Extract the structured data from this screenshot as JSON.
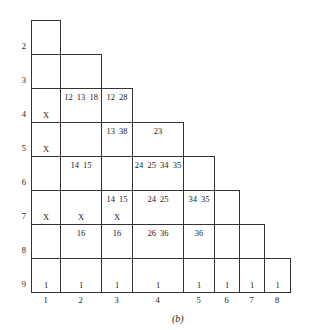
{
  "caption": "(b)",
  "geometry": {
    "col_edges": [
      31,
      60,
      101,
      132,
      183,
      214,
      239,
      264,
      290
    ],
    "row_edges": [
      20,
      54,
      88,
      122,
      156,
      190,
      224,
      258,
      292
    ]
  },
  "row_labels": [
    "2",
    "3",
    "4",
    "5",
    "6",
    "7",
    "8",
    "9"
  ],
  "col_labels": [
    "1",
    "2",
    "3",
    "4",
    "5",
    "6",
    "7",
    "8"
  ],
  "cells": [
    {
      "row": 2,
      "col": 1,
      "top": "",
      "bottom": ""
    },
    {
      "row": 3,
      "col": 1,
      "top": "",
      "bottom": ""
    },
    {
      "row": 3,
      "col": 2,
      "top": "",
      "bottom": ""
    },
    {
      "row": 4,
      "col": 1,
      "top": "",
      "bottom": "X"
    },
    {
      "row": 4,
      "col": 2,
      "top": "12 13 18",
      "bottom": ""
    },
    {
      "row": 4,
      "col": 3,
      "top": "12 28",
      "bottom": ""
    },
    {
      "row": 5,
      "col": 1,
      "top": "",
      "bottom": "X"
    },
    {
      "row": 5,
      "col": 2,
      "top": "",
      "bottom": ""
    },
    {
      "row": 5,
      "col": 3,
      "top": "13 38",
      "bottom": ""
    },
    {
      "row": 5,
      "col": 4,
      "top": "23",
      "bottom": ""
    },
    {
      "row": 6,
      "col": 1,
      "top": "",
      "bottom": ""
    },
    {
      "row": 6,
      "col": 2,
      "top": "14 15",
      "bottom": ""
    },
    {
      "row": 6,
      "col": 3,
      "top": "",
      "bottom": ""
    },
    {
      "row": 6,
      "col": 4,
      "top": "24 25 34 35",
      "bottom": ""
    },
    {
      "row": 6,
      "col": 5,
      "top": "",
      "bottom": ""
    },
    {
      "row": 7,
      "col": 1,
      "top": "",
      "bottom": "X"
    },
    {
      "row": 7,
      "col": 2,
      "top": "",
      "bottom": "X"
    },
    {
      "row": 7,
      "col": 3,
      "top": "14 15",
      "bottom": "X"
    },
    {
      "row": 7,
      "col": 4,
      "top": "24 25",
      "bottom": ""
    },
    {
      "row": 7,
      "col": 5,
      "top": "34 35",
      "bottom": ""
    },
    {
      "row": 7,
      "col": 6,
      "top": "",
      "bottom": ""
    },
    {
      "row": 8,
      "col": 1,
      "top": "",
      "bottom": ""
    },
    {
      "row": 8,
      "col": 2,
      "top": "16",
      "bottom": ""
    },
    {
      "row": 8,
      "col": 3,
      "top": "16",
      "bottom": ""
    },
    {
      "row": 8,
      "col": 4,
      "top": "26 36",
      "bottom": ""
    },
    {
      "row": 8,
      "col": 5,
      "top": "36",
      "bottom": ""
    },
    {
      "row": 8,
      "col": 6,
      "top": "",
      "bottom": ""
    },
    {
      "row": 8,
      "col": 7,
      "top": "",
      "bottom": ""
    },
    {
      "row": 9,
      "col": 1,
      "top": "",
      "bottom": "1"
    },
    {
      "row": 9,
      "col": 2,
      "top": "",
      "bottom": "1"
    },
    {
      "row": 9,
      "col": 3,
      "top": "",
      "bottom": "1"
    },
    {
      "row": 9,
      "col": 4,
      "top": "",
      "bottom": "1"
    },
    {
      "row": 9,
      "col": 5,
      "top": "",
      "bottom": "1"
    },
    {
      "row": 9,
      "col": 6,
      "top": "",
      "bottom": "1"
    },
    {
      "row": 9,
      "col": 7,
      "top": "",
      "bottom": "1"
    },
    {
      "row": 9,
      "col": 8,
      "top": "",
      "bottom": "1"
    }
  ]
}
